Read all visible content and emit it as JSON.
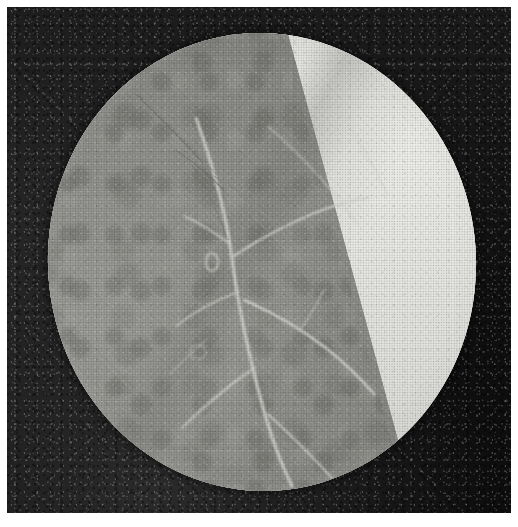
{
  "plate": {
    "kind": "halftone-photomicrograph",
    "medium": "printed book plate, black and white halftone",
    "width": 518,
    "height": 527,
    "page_margin_px": 7,
    "caption": "",
    "label": ""
  },
  "photo": {
    "name": "photographic-print",
    "left": 7,
    "top": 7,
    "width": 504,
    "height": 506,
    "background_color": "#161616",
    "background_description": "dark, coarsely grained photographic ground surrounding the circular field",
    "corner_tones": {
      "top_left": "#1d1d1d",
      "top_right": "#0d0d0d",
      "bottom_left": "#272727",
      "bottom_right": "#0b0b0b"
    }
  },
  "field_of_view": {
    "name": "microscope-field-of-view",
    "shape": "circle",
    "center_x": 262,
    "center_y": 262,
    "radius_x": 214,
    "radius_y": 229,
    "rotation_deg": -4,
    "description": "bright circular microscope field stop containing a leaf surface"
  },
  "regions": [
    {
      "name": "bright-region",
      "position": "upper-right of the field",
      "tone": "#e6e6e2",
      "description": "strongly illuminated pale area of the specimen"
    },
    {
      "name": "lamina-region",
      "position": "lower-left of the field",
      "tone": "#8e8e8a",
      "description": "mid-grey mottled leaf lamina with cellular texture"
    },
    {
      "name": "tone-boundary",
      "description": "diagonal margin separating the pale region from the grey lamina, running from upper-left to lower-right",
      "start_x": 236,
      "start_y": 205,
      "end_x": 362,
      "end_y": 402,
      "angle_deg": 57
    }
  ],
  "veins": [
    {
      "name": "vein-main-midrib",
      "d": "M 196 118 C 214 168, 226 214, 232 258 C 238 306, 248 352, 262 404 C 272 440, 282 466, 292 486",
      "width": 3.0,
      "tone": "#dcdcd8"
    },
    {
      "name": "vein-lateral-upper-right",
      "d": "M 234 256 C 258 240, 284 226, 312 214 C 334 205, 352 200, 368 198",
      "width": 2.4,
      "tone": "#d6d6d2"
    },
    {
      "name": "vein-lateral-upper-left",
      "d": "M 230 244 C 214 232, 198 222, 184 216",
      "width": 2.0,
      "tone": "#cfcfcb"
    },
    {
      "name": "vein-lateral-mid-right",
      "d": "M 244 300 C 272 312, 300 328, 326 348 C 346 364, 362 380, 374 394",
      "width": 2.6,
      "tone": "#dedeDA"
    },
    {
      "name": "vein-lateral-mid-left",
      "d": "M 238 292 C 216 300, 194 312, 176 326",
      "width": 2.0,
      "tone": "#cbcbc7"
    },
    {
      "name": "vein-lateral-lower-left",
      "d": "M 254 368 C 228 386, 204 406, 182 428",
      "width": 2.2,
      "tone": "#d2d2ce"
    },
    {
      "name": "vein-lateral-lower-right",
      "d": "M 268 414 C 292 436, 314 458, 332 478",
      "width": 2.2,
      "tone": "#d6d6d2"
    },
    {
      "name": "vein-branch-fine-a",
      "d": "M 300 330 C 310 316, 318 302, 324 290",
      "width": 1.4,
      "tone": "#c8c8c4"
    },
    {
      "name": "vein-branch-fine-b",
      "d": "M 206 340 C 192 352, 180 364, 170 374",
      "width": 1.3,
      "tone": "#c2c2be"
    },
    {
      "name": "vein-faint-bright-region",
      "d": "M 268 126 C 300 154, 330 186, 356 222",
      "width": 1.2,
      "tone": "#d3d3cf"
    },
    {
      "name": "vein-faint-bright-region-2",
      "d": "M 330 96 C 352 128, 372 162, 388 196",
      "width": 1.0,
      "tone": "#d5d5d1"
    }
  ],
  "hairs": [
    {
      "name": "trichome-hair-1",
      "d": "M 136 94 C 160 118, 184 142, 204 164",
      "width": 1.1,
      "tone": "#6f6f6b"
    },
    {
      "name": "trichome-hair-2",
      "d": "M 142 100 C 168 124, 194 150, 216 174",
      "width": 0.9,
      "tone": "#7a7a76"
    },
    {
      "name": "trichome-hair-3",
      "d": "M 176 150 C 196 164, 212 178, 224 190",
      "width": 1.0,
      "tone": "#747470"
    },
    {
      "name": "trichome-hair-4",
      "d": "M 214 176 C 240 192, 266 210, 286 226",
      "width": 1.0,
      "tone": "#8a8a86"
    },
    {
      "name": "trichome-hair-5",
      "d": "M 238 198 C 266 214, 292 232, 312 248",
      "width": 0.9,
      "tone": "#9a9a96"
    },
    {
      "name": "trichome-hair-6",
      "d": "M 190 162 C 206 186, 218 212, 226 236",
      "width": 0.9,
      "tone": "#787874"
    },
    {
      "name": "trichome-hair-7",
      "d": "M 252 216 C 274 236, 294 258, 308 278",
      "width": 0.8,
      "tone": "#a2a29e"
    }
  ],
  "features": [
    {
      "name": "gland-oval",
      "description": "small bright oval body (gland or stoma) on the lamina",
      "center_x": 212,
      "center_y": 262,
      "radius_x": 6,
      "radius_y": 9,
      "tone": "#cfcfcb"
    },
    {
      "name": "gland-oval-secondary",
      "description": "fainter rounded body below and left of the first",
      "center_x": 198,
      "center_y": 352,
      "radius_x": 8,
      "radius_y": 7,
      "tone": "#a8a8a4"
    }
  ],
  "colors": {
    "page": "#ffffff",
    "print_dark": "#161616",
    "field_bright": "#e6e6e2",
    "field_lamina": "#8e8e8a",
    "vein_light": "#dcdcd8"
  }
}
